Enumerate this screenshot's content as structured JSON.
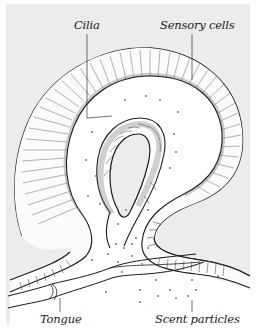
{
  "figure": {
    "colors": {
      "background": "#ececec",
      "border": "#ffffff",
      "ink": "#1a1a1a",
      "tissue": "#ffffff",
      "hatching": "#555555",
      "particles": "#777777"
    }
  },
  "labels": {
    "cilia": "Cilia",
    "sensory_cells": "Sensory cells",
    "tongue": "Tongue",
    "scent_particles": "Scent particles"
  }
}
